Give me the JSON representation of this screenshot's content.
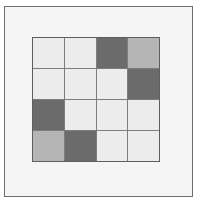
{
  "figure": {
    "background_color": "#ffffff",
    "panel_color": "#f5f5f5",
    "frame_color": "#6e6e6e",
    "gridline_color": "#7d7d7d"
  },
  "chart_data": {
    "type": "heatmap",
    "title": "",
    "xlabel": "",
    "ylabel": "",
    "rows": 4,
    "cols": 4,
    "grid": true,
    "legend": "none",
    "palette": {
      "light": "#ececec",
      "medium": "#b5b5b5",
      "dark": "#6b6b6b"
    },
    "categories": [
      "1",
      "2",
      "3",
      "4"
    ],
    "row_labels": [
      "1",
      "2",
      "3",
      "4"
    ],
    "values": [
      [
        0,
        0,
        2,
        1
      ],
      [
        0,
        0,
        0,
        2
      ],
      [
        2,
        0,
        0,
        0
      ],
      [
        1,
        2,
        0,
        0
      ]
    ],
    "value_levels": [
      0,
      1,
      2
    ],
    "value_colors": [
      "#ececec",
      "#b5b5b5",
      "#6b6b6b"
    ],
    "cells": [
      {
        "row": 1,
        "col": 1,
        "shade": "light",
        "color": "#ececec",
        "value": 0
      },
      {
        "row": 1,
        "col": 2,
        "shade": "light",
        "color": "#ececec",
        "value": 0
      },
      {
        "row": 1,
        "col": 3,
        "shade": "dark",
        "color": "#6b6b6b",
        "value": 2
      },
      {
        "row": 1,
        "col": 4,
        "shade": "medium",
        "color": "#b5b5b5",
        "value": 1
      },
      {
        "row": 2,
        "col": 1,
        "shade": "light",
        "color": "#ececec",
        "value": 0
      },
      {
        "row": 2,
        "col": 2,
        "shade": "light",
        "color": "#ececec",
        "value": 0
      },
      {
        "row": 2,
        "col": 3,
        "shade": "light",
        "color": "#ececec",
        "value": 0
      },
      {
        "row": 2,
        "col": 4,
        "shade": "dark",
        "color": "#6b6b6b",
        "value": 2
      },
      {
        "row": 3,
        "col": 1,
        "shade": "dark",
        "color": "#6b6b6b",
        "value": 2
      },
      {
        "row": 3,
        "col": 2,
        "shade": "light",
        "color": "#ececec",
        "value": 0
      },
      {
        "row": 3,
        "col": 3,
        "shade": "light",
        "color": "#ececec",
        "value": 0
      },
      {
        "row": 3,
        "col": 4,
        "shade": "light",
        "color": "#ececec",
        "value": 0
      },
      {
        "row": 4,
        "col": 1,
        "shade": "medium",
        "color": "#b5b5b5",
        "value": 1
      },
      {
        "row": 4,
        "col": 2,
        "shade": "dark",
        "color": "#6b6b6b",
        "value": 2
      },
      {
        "row": 4,
        "col": 3,
        "shade": "light",
        "color": "#ececec",
        "value": 0
      },
      {
        "row": 4,
        "col": 4,
        "shade": "light",
        "color": "#ececec",
        "value": 0
      }
    ]
  }
}
